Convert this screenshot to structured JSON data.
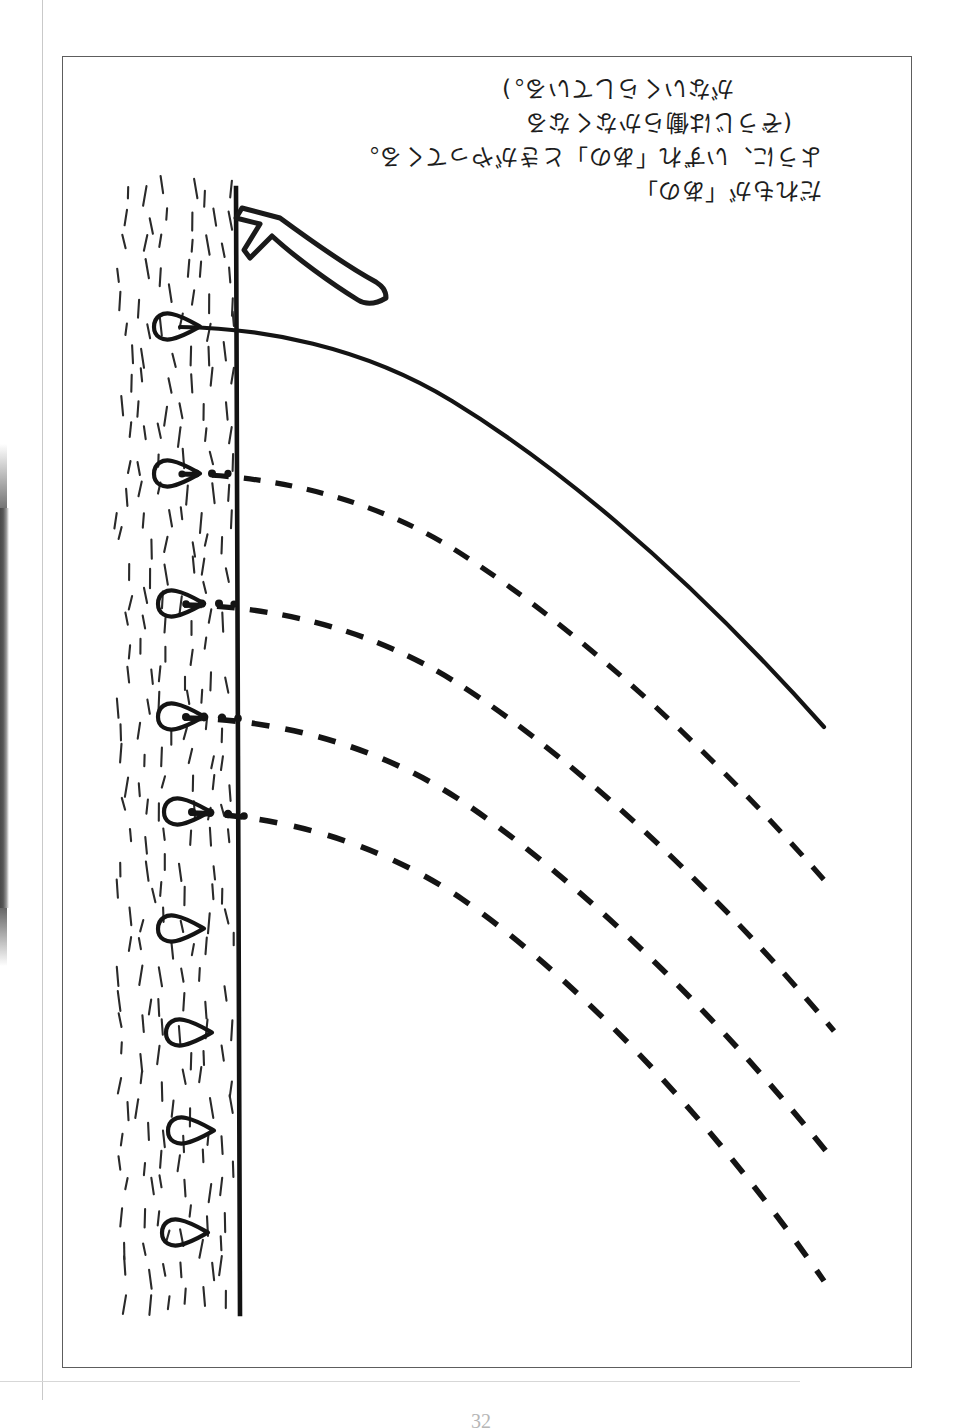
{
  "page": {
    "folio": "32",
    "orientation_note": "rotated-180"
  },
  "caption": {
    "lines": [
      "だれもが「あの」",
      "ように、いずれ「あの」ときがやってくる。",
      "(ぞうじは働らかなくなる",
      "がないくらしている。)"
    ],
    "line1": "だれもが「あの」",
    "line2": "ように、いずれ「あの」ときがやってくる。",
    "line3": "(ぞうじは働らかなくなる",
    "line4": "がないくらしている。)"
  },
  "annotation": {
    "arrow_label": "hand-drawn-arrow",
    "arrow_direction": "down-right"
  },
  "chart_data": {
    "type": "line",
    "title": "",
    "xlabel": "",
    "ylabel": "",
    "xlim": [
      0,
      100
    ],
    "ylim": [
      0,
      100
    ],
    "grid": false,
    "legend": "none",
    "axis": {
      "vertical_axis_x": 100,
      "axis_style": "solid",
      "hatched_band": {
        "x_start": 0,
        "x_end": 100,
        "pattern": "short-slanted-ticks"
      }
    },
    "markers": {
      "shape": "teardrop",
      "count": 9,
      "y_values": [
        92,
        73,
        62,
        50,
        42,
        32,
        24,
        16,
        8
      ],
      "with_curve": [
        true,
        true,
        true,
        true,
        true,
        false,
        false,
        false,
        false
      ]
    },
    "series": [
      {
        "name": "curve-1",
        "style": "solid",
        "start": [
          0,
          92
        ],
        "points": [
          [
            0,
            92
          ],
          [
            20,
            91
          ],
          [
            40,
            87
          ],
          [
            60,
            79
          ],
          [
            80,
            67
          ],
          [
            100,
            53
          ]
        ]
      },
      {
        "name": "curve-2",
        "style": "dashed",
        "start": [
          0,
          73
        ],
        "points": [
          [
            0,
            73
          ],
          [
            20,
            72
          ],
          [
            40,
            68
          ],
          [
            60,
            60
          ],
          [
            80,
            47
          ],
          [
            100,
            32
          ]
        ]
      },
      {
        "name": "curve-3",
        "style": "dashed",
        "start": [
          0,
          62
        ],
        "points": [
          [
            0,
            62
          ],
          [
            20,
            61
          ],
          [
            40,
            57
          ],
          [
            60,
            49
          ],
          [
            80,
            36
          ],
          [
            100,
            21
          ]
        ]
      },
      {
        "name": "curve-4",
        "style": "dashed",
        "start": [
          0,
          50
        ],
        "points": [
          [
            0,
            50
          ],
          [
            20,
            49
          ],
          [
            40,
            45
          ],
          [
            60,
            37
          ],
          [
            80,
            24
          ],
          [
            100,
            9
          ]
        ]
      },
      {
        "name": "curve-5",
        "style": "dashed",
        "start": [
          0,
          42
        ],
        "points": [
          [
            0,
            42
          ],
          [
            20,
            41
          ],
          [
            40,
            37
          ],
          [
            60,
            28
          ],
          [
            80,
            14
          ],
          [
            100,
            0
          ]
        ]
      }
    ],
    "colors": {
      "ink": "#1a1a1a",
      "paper": "#ffffff",
      "frame": "#5d5d5d"
    }
  }
}
